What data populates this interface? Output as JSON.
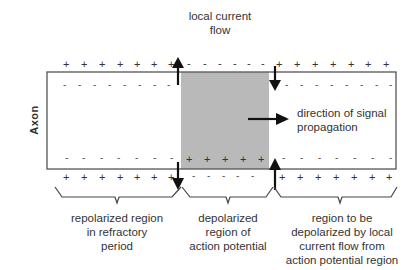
{
  "diagram": {
    "title_top": {
      "line1": "local current",
      "line2": "flow"
    },
    "axon_label": "Axon",
    "direction_label": {
      "line1": "direction of signal",
      "line2": "propagation"
    },
    "regions": [
      {
        "name": "repolarized",
        "lines": [
          "repolarized region",
          "in refractory",
          "period"
        ]
      },
      {
        "name": "depolarized",
        "lines": [
          "depolarized",
          "region of",
          "action potential"
        ]
      },
      {
        "name": "to-be-depolarized",
        "lines": [
          "region to be",
          "depolarized by local",
          "current flow from",
          "action potential region"
        ]
      }
    ],
    "charges": {
      "outside_left": "+",
      "inside_left": "-",
      "outside_middle": "-",
      "inside_middle": "+",
      "outside_right": "+",
      "inside_right": "-"
    },
    "colors": {
      "outline": "#555555",
      "shaded": "#b8b8b8",
      "arrow": "#111111",
      "text": "#333333"
    }
  }
}
